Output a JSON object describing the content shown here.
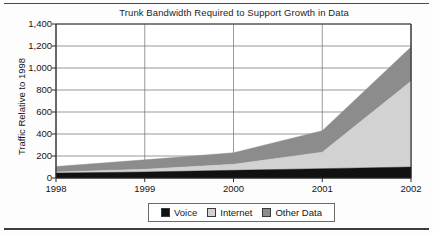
{
  "chart_data": {
    "type": "area",
    "stacked": true,
    "title": "Trunk Bandwidth Required to Support Growth in Data",
    "xlabel": "",
    "ylabel": "Traffic Relative to 1998",
    "categories": [
      "1998",
      "1999",
      "2000",
      "2001",
      "2002"
    ],
    "x": [
      1998,
      1999,
      2000,
      2001,
      2002
    ],
    "series": [
      {
        "name": "Voice",
        "color": "#111111",
        "values": [
          45,
          55,
          70,
          85,
          100
        ]
      },
      {
        "name": "Internet",
        "color": "#d2d2d2",
        "values": [
          10,
          25,
          55,
          150,
          780
        ]
      },
      {
        "name": "Other Data",
        "color": "#8c8c8c",
        "values": [
          50,
          85,
          105,
          195,
          310
        ]
      }
    ],
    "cumulative_totals": [
      105,
      165,
      230,
      430,
      1190
    ],
    "ylim": [
      0,
      1400
    ],
    "ytick_values": [
      0,
      200,
      400,
      600,
      800,
      1000,
      1200,
      1400
    ],
    "ytick_labels": [
      "0",
      "200",
      "400",
      "600",
      "800",
      "1,000",
      "1,200",
      "1,400"
    ],
    "grid": true,
    "legend_position": "bottom"
  },
  "legend": {
    "items": [
      {
        "label": "Voice",
        "color": "#111111"
      },
      {
        "label": "Internet",
        "color": "#d2d2d2"
      },
      {
        "label": "Other Data",
        "color": "#8c8c8c"
      }
    ]
  }
}
